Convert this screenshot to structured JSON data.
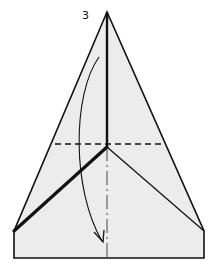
{
  "diagram": {
    "type": "origami-fold-instruction",
    "step_number": "3",
    "colors": {
      "paper": "#ececec",
      "outline": "#111111",
      "background": "#ffffff"
    },
    "elements": [
      {
        "name": "paper-shape",
        "description": "folded paper silhouette: triangle point on top of a rectangular base"
      },
      {
        "name": "center-crease",
        "style": "solid (upper) / dash-dot (lower)",
        "description": "vertical center line"
      },
      {
        "name": "valley-fold-line",
        "style": "dashed",
        "description": "horizontal fold line across the upper part"
      },
      {
        "name": "left-edge-fold",
        "style": "thick solid",
        "description": "diagonal folded edge on the left"
      },
      {
        "name": "right-edge-crease",
        "style": "thin solid",
        "description": "diagonal crease on the right"
      },
      {
        "name": "fold-arrow",
        "description": "curved arrow indicating tip folds down"
      }
    ]
  }
}
